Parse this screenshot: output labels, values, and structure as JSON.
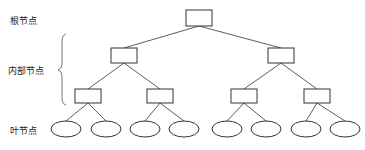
{
  "labels": {
    "root": "根节点",
    "internal": "内部节点",
    "leaf": "叶节点"
  },
  "tree": {
    "root": {
      "x": 186,
      "y": 10,
      "w": 26,
      "h": 16
    },
    "level1": [
      {
        "x": 111,
        "y": 48,
        "w": 26,
        "h": 15
      },
      {
        "x": 268,
        "y": 48,
        "w": 26,
        "h": 15
      }
    ],
    "level2": [
      {
        "x": 75,
        "y": 89,
        "w": 26,
        "h": 14
      },
      {
        "x": 147,
        "y": 89,
        "w": 26,
        "h": 14
      },
      {
        "x": 231,
        "y": 89,
        "w": 26,
        "h": 14
      },
      {
        "x": 304,
        "y": 89,
        "w": 26,
        "h": 14
      }
    ],
    "leaves": [
      66,
      106,
      145,
      184,
      227,
      266,
      306,
      345
    ],
    "leaf_y": 129,
    "leaf_rx": 15,
    "leaf_ry": 8
  },
  "colors": {
    "stroke": "#333333"
  }
}
